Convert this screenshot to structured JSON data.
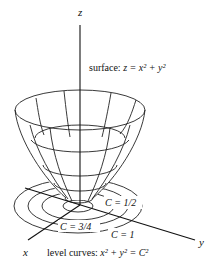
{
  "figure": {
    "type": "3d-surface-with-level-curves",
    "axes": {
      "z_label": "z",
      "x_label": "x",
      "y_label": "y"
    },
    "surface_label": {
      "prefix": "surface: ",
      "equation": "z = x² + y²"
    },
    "level_curves_label": {
      "prefix": "level curves: ",
      "equation": "x² + y² = C²"
    },
    "level_curve_labels": [
      {
        "id": "c-half",
        "text": "C = 1/2"
      },
      {
        "id": "c-three-quarters",
        "text": "C = 3/4"
      },
      {
        "id": "c-one",
        "text": "C = 1"
      }
    ],
    "colors": {
      "line": "#222222",
      "background": "#ffffff"
    }
  }
}
